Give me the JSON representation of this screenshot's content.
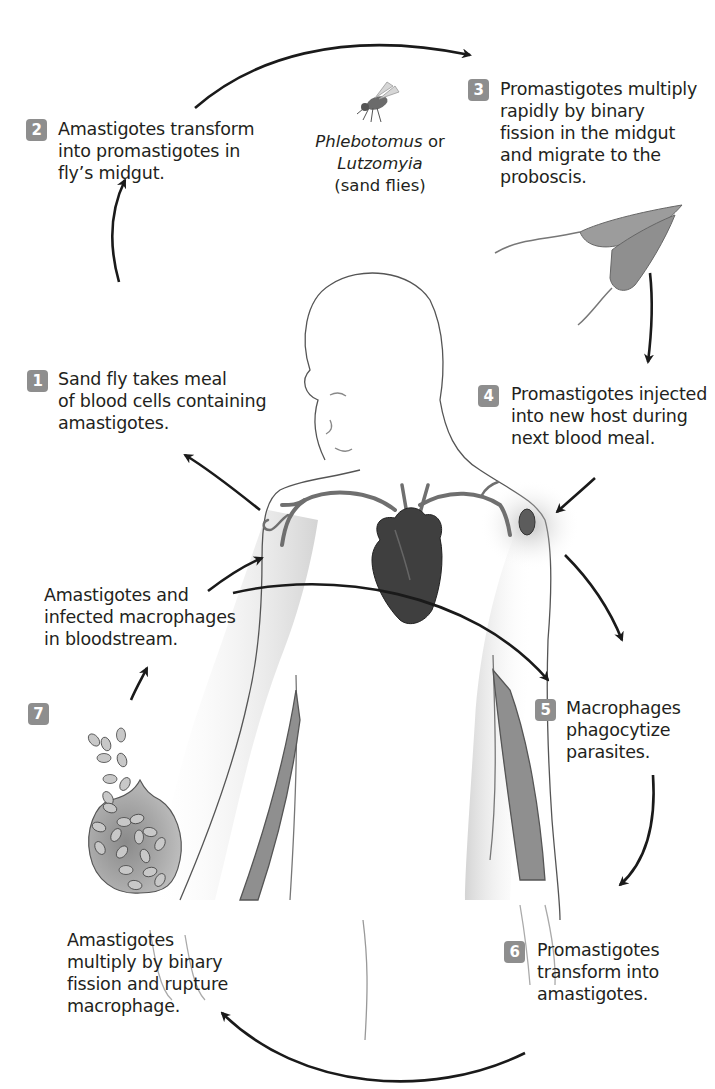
{
  "figure": {
    "badge_color": "#8e8e8e",
    "text_color": "#231f20",
    "arrow_color": "#1a1a1a",
    "heart_color": "#4a4a4a"
  },
  "vector": {
    "genus1": "Phlebotomus",
    "joiner": " or",
    "genus2": "Lutzomyia",
    "common": "(sand flies)",
    "icon": "sand-fly-icon"
  },
  "steps": [
    {
      "number": "1",
      "text": "Sand fly takes meal\nof blood cells containing\namastigotes."
    },
    {
      "number": "2",
      "text": "Amastigotes transform\ninto promastigotes in\nfly’s midgut."
    },
    {
      "number": "3",
      "text": "Promastigotes multiply\nrapidly by binary\nfission in the midgut\nand migrate to the\nproboscis."
    },
    {
      "number": "4",
      "text": "Promastigotes injected\ninto new host during\nnext blood meal."
    },
    {
      "number": "5",
      "text": "Macrophages\nphagocytize\nparasites."
    },
    {
      "number": "6",
      "text": "Promastigotes\ntransform into\namastigotes."
    },
    {
      "number": "7",
      "text": ""
    }
  ],
  "annotations": {
    "bloodstream": "Amastigotes and\ninfected macrophages\nin bloodstream.",
    "rupture": "Amastigotes\nmultiply by binary\nfission and rupture\nmacrophage."
  },
  "illustrations": [
    "human-figure",
    "heart-icon",
    "promastigote-icon",
    "macrophage-icon",
    "lesion-icon"
  ]
}
